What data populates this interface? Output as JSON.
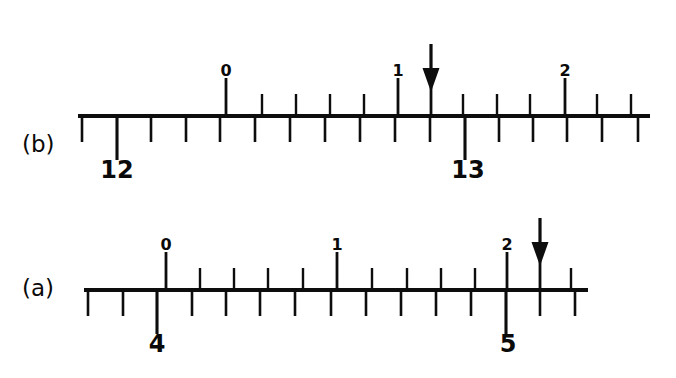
{
  "figure": {
    "background_color": "#ffffff",
    "ink_color": "#0d0d0d",
    "panels": [
      {
        "id": "panel-b",
        "label": "(b)",
        "label_x": 22,
        "label_y": 152,
        "baseline_y": 116,
        "bar_x_start": 78,
        "bar_x_end": 650,
        "main_scale": {
          "tick_length_short": 26,
          "tick_length_long": 44,
          "ticks": [
            {
              "x": 82,
              "long": false
            },
            {
              "x": 117,
              "long": true,
              "label": "12",
              "label_x": 117,
              "label_y": 178
            },
            {
              "x": 151,
              "long": false
            },
            {
              "x": 186,
              "long": false
            },
            {
              "x": 220,
              "long": false
            },
            {
              "x": 255,
              "long": false
            },
            {
              "x": 290,
              "long": false
            },
            {
              "x": 325,
              "long": false
            },
            {
              "x": 360,
              "long": false
            },
            {
              "x": 395,
              "long": false
            },
            {
              "x": 430,
              "long": false
            },
            {
              "x": 465,
              "long": true,
              "label": "13",
              "label_x": 468,
              "label_y": 178
            },
            {
              "x": 499,
              "long": false
            },
            {
              "x": 533,
              "long": false
            },
            {
              "x": 567,
              "long": false
            },
            {
              "x": 602,
              "long": false
            },
            {
              "x": 638,
              "long": false
            }
          ],
          "labels": [
            "12",
            "13"
          ]
        },
        "vernier_scale": {
          "tick_length_short": 22,
          "tick_length_long": 38,
          "ticks": [
            {
              "x": 226,
              "long": true,
              "label": "0",
              "label_x": 226,
              "label_y": 76
            },
            {
              "x": 262,
              "long": false
            },
            {
              "x": 296,
              "long": false
            },
            {
              "x": 330,
              "long": false
            },
            {
              "x": 364,
              "long": false
            },
            {
              "x": 398,
              "long": true,
              "label": "1",
              "label_x": 398,
              "label_y": 76
            },
            {
              "x": 431,
              "long": true
            },
            {
              "x": 463,
              "long": false
            },
            {
              "x": 497,
              "long": false
            },
            {
              "x": 530,
              "long": false
            },
            {
              "x": 565,
              "long": true,
              "label": "2",
              "label_x": 565,
              "label_y": 76
            },
            {
              "x": 597,
              "long": false
            },
            {
              "x": 631,
              "long": false
            }
          ],
          "labels": [
            "0",
            "1",
            "2"
          ]
        },
        "arrow": {
          "x": 431,
          "top_y": 44,
          "tip_y": 92,
          "head_width": 17,
          "head_height": 24
        }
      },
      {
        "id": "panel-a",
        "label": "(a)",
        "label_x": 22,
        "label_y": 296,
        "baseline_y": 290,
        "bar_x_start": 84,
        "bar_x_end": 588,
        "main_scale": {
          "tick_length_short": 26,
          "tick_length_long": 44,
          "ticks": [
            {
              "x": 88,
              "long": false
            },
            {
              "x": 123,
              "long": false
            },
            {
              "x": 157,
              "long": true,
              "label": "4",
              "label_x": 157,
              "label_y": 352
            },
            {
              "x": 192,
              "long": false
            },
            {
              "x": 226,
              "long": false
            },
            {
              "x": 260,
              "long": false
            },
            {
              "x": 295,
              "long": false
            },
            {
              "x": 331,
              "long": false
            },
            {
              "x": 366,
              "long": false
            },
            {
              "x": 401,
              "long": false
            },
            {
              "x": 436,
              "long": false
            },
            {
              "x": 471,
              "long": false
            },
            {
              "x": 506,
              "long": true,
              "label": "5",
              "label_x": 508,
              "label_y": 352
            },
            {
              "x": 540,
              "long": false
            },
            {
              "x": 575,
              "long": false
            }
          ],
          "labels": [
            "4",
            "5"
          ]
        },
        "vernier_scale": {
          "tick_length_short": 22,
          "tick_length_long": 38,
          "ticks": [
            {
              "x": 166,
              "long": true,
              "label": "0",
              "label_x": 166,
              "label_y": 250
            },
            {
              "x": 200,
              "long": false
            },
            {
              "x": 234,
              "long": false
            },
            {
              "x": 268,
              "long": false
            },
            {
              "x": 303,
              "long": false
            },
            {
              "x": 337,
              "long": true,
              "label": "1",
              "label_x": 337,
              "label_y": 250
            },
            {
              "x": 372,
              "long": false
            },
            {
              "x": 407,
              "long": false
            },
            {
              "x": 441,
              "long": false
            },
            {
              "x": 475,
              "long": false
            },
            {
              "x": 507,
              "long": true,
              "label": "2",
              "label_x": 507,
              "label_y": 250
            },
            {
              "x": 540,
              "long": true
            },
            {
              "x": 571,
              "long": false
            }
          ],
          "labels": [
            "0",
            "1",
            "2"
          ]
        },
        "arrow": {
          "x": 540,
          "top_y": 218,
          "tip_y": 266,
          "head_width": 17,
          "head_height": 24
        }
      }
    ]
  }
}
